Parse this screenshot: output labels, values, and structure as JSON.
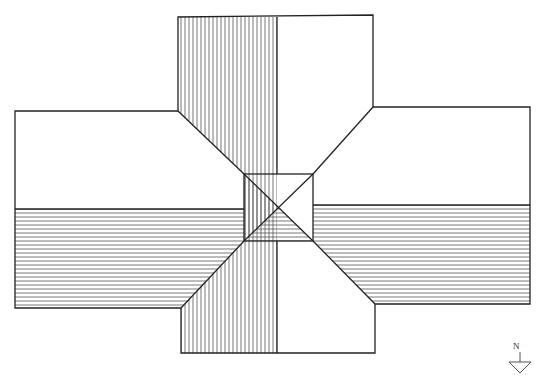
{
  "diagram": {
    "type": "roof-plan",
    "north_arrow": {
      "label": "N"
    },
    "colors": {
      "line": "#222222",
      "hatch": "#555555",
      "background": "#ffffff"
    }
  }
}
